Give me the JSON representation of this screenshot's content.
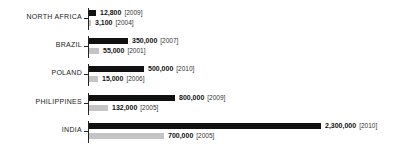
{
  "chart_data": {
    "type": "bar",
    "orientation": "horizontal",
    "title": "",
    "xlabel": "",
    "ylabel": "",
    "grid": false,
    "legend": null,
    "categories": [
      "NORTH AFRICA",
      "BRAZIL",
      "POLAND",
      "PHILIPPINES",
      "INDIA"
    ],
    "series": [
      {
        "name": "latest",
        "color": "#111111",
        "values": [
          12800,
          350000,
          500000,
          800000,
          2300000
        ],
        "labels": [
          "12,800",
          "350,000",
          "500,000",
          "800,000",
          "2,300,000"
        ],
        "years": [
          "[2009]",
          "[2007]",
          "[2010]",
          "[2009]",
          "[2010]"
        ]
      },
      {
        "name": "earlier",
        "color": "#c4c4c4",
        "values": [
          3100,
          55000,
          15000,
          132000,
          700000
        ],
        "labels": [
          "3,100",
          "55,000",
          "15,000",
          "132,000",
          "700,000"
        ],
        "years": [
          "[2004]",
          "[2001]",
          "[2006]",
          "[2005]",
          "[2005]"
        ]
      }
    ]
  },
  "groups": [
    {
      "label": "NORTH AFRICA",
      "a": {
        "w": 7,
        "v": "12,800",
        "y": "[2009]"
      },
      "b": {
        "w": 2,
        "v": "3,100",
        "y": "[2004]"
      }
    },
    {
      "label": "BRAZIL",
      "a": {
        "w": 39,
        "v": "350,000",
        "y": "[2007]"
      },
      "b": {
        "w": 10,
        "v": "55,000",
        "y": "[2001]"
      }
    },
    {
      "label": "POLAND",
      "a": {
        "w": 55,
        "v": "500,000",
        "y": "[2010]"
      },
      "b": {
        "w": 9,
        "v": "15,000",
        "y": "[2006]"
      }
    },
    {
      "label": "PHILIPPINES",
      "a": {
        "w": 86,
        "v": "800,000",
        "y": "[2009]"
      },
      "b": {
        "w": 19,
        "v": "132,000",
        "y": "[2005]"
      }
    },
    {
      "label": "INDIA",
      "a": {
        "w": 232,
        "v": "2,300,000",
        "y": "[2010]"
      },
      "b": {
        "w": 75,
        "v": "700,000",
        "y": "[2005]"
      }
    }
  ]
}
